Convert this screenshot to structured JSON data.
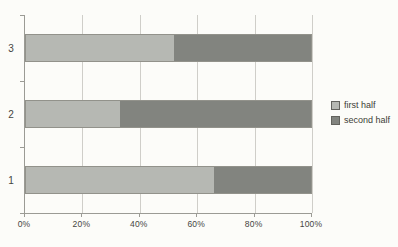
{
  "figure": {
    "background_color": "#fcfcf9",
    "axis_color": "#9b9b95",
    "gridline_color": "#cfcec9",
    "tick_label_color": "#45453f"
  },
  "chart_data": {
    "type": "bar",
    "orientation": "horizontal",
    "stacked": true,
    "normalized_to_100_percent": true,
    "title": "",
    "xlabel": "",
    "ylabel": "",
    "categories": [
      "3",
      "2",
      "1"
    ],
    "series": [
      {
        "name": "first half",
        "color": "#b6b8b3",
        "values": [
          52,
          33,
          66
        ]
      },
      {
        "name": "second half",
        "color": "#82847f",
        "values": [
          48,
          67,
          34
        ]
      }
    ],
    "x_ticks": [
      "0%",
      "20%",
      "40%",
      "60%",
      "80%",
      "100%"
    ],
    "xlim": [
      0,
      100
    ],
    "grid": "vertical-only",
    "legend_position": "right-center"
  }
}
